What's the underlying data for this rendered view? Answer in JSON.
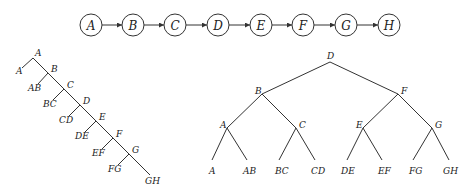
{
  "chain": {
    "nodes": [
      {
        "label": "A",
        "cx": 91
      },
      {
        "label": "B",
        "cx": 133
      },
      {
        "label": "C",
        "cx": 175
      },
      {
        "label": "D",
        "cx": 218
      },
      {
        "label": "E",
        "cx": 261
      },
      {
        "label": "F",
        "cx": 303
      },
      {
        "label": "G",
        "cx": 346
      },
      {
        "label": "H",
        "cx": 389
      }
    ],
    "cy": 25,
    "r": 11
  },
  "left_tree": {
    "spine_nodes": [
      {
        "label": "A",
        "x": 33,
        "y": 58,
        "lx": 35,
        "ly": 56
      },
      {
        "label": "B",
        "x": 48,
        "y": 73,
        "lx": 51,
        "ly": 72
      },
      {
        "label": "C",
        "x": 64,
        "y": 89,
        "lx": 67,
        "ly": 88
      },
      {
        "label": "D",
        "x": 80,
        "y": 105,
        "lx": 83,
        "ly": 104
      },
      {
        "label": "E",
        "x": 96,
        "y": 121,
        "lx": 99,
        "ly": 120
      },
      {
        "label": "F",
        "x": 113,
        "y": 138,
        "lx": 116,
        "ly": 137
      },
      {
        "label": "G",
        "x": 129,
        "y": 154,
        "lx": 132,
        "ly": 153
      }
    ],
    "leaves": [
      {
        "label": "A",
        "x": 22,
        "y": 68,
        "lx": 16,
        "ly": 74
      },
      {
        "label": "AB",
        "x": 38,
        "y": 84,
        "lx": 28,
        "ly": 91
      },
      {
        "label": "BC",
        "x": 53,
        "y": 100,
        "lx": 43,
        "ly": 107
      },
      {
        "label": "CD",
        "x": 69,
        "y": 116,
        "lx": 59,
        "ly": 123
      },
      {
        "label": "DE",
        "x": 85,
        "y": 132,
        "lx": 75,
        "ly": 139
      },
      {
        "label": "EF",
        "x": 102,
        "y": 149,
        "lx": 92,
        "ly": 156
      },
      {
        "label": "FG",
        "x": 118,
        "y": 165,
        "lx": 108,
        "ly": 172
      }
    ],
    "end": {
      "label": "GH",
      "x": 150,
      "y": 175,
      "lx": 145,
      "ly": 184
    }
  },
  "right_tree": {
    "internal": [
      {
        "id": "D",
        "label": "D",
        "x": 330,
        "y": 62,
        "lx": 327,
        "ly": 59
      },
      {
        "id": "B",
        "label": "B",
        "x": 262,
        "y": 94,
        "lx": 255,
        "ly": 94
      },
      {
        "id": "F",
        "label": "F",
        "x": 398,
        "y": 94,
        "lx": 401,
        "ly": 94
      },
      {
        "id": "A",
        "label": "A",
        "x": 227,
        "y": 128,
        "lx": 220,
        "ly": 128
      },
      {
        "id": "C",
        "label": "C",
        "x": 296,
        "y": 128,
        "lx": 299,
        "ly": 128
      },
      {
        "id": "E",
        "label": "E",
        "x": 363,
        "y": 128,
        "lx": 356,
        "ly": 128
      },
      {
        "id": "G",
        "label": "G",
        "x": 432,
        "y": 128,
        "lx": 435,
        "ly": 128
      }
    ],
    "leaves": [
      {
        "label": "A",
        "parent": "A",
        "x": 212,
        "y": 160,
        "lx": 209,
        "ly": 174
      },
      {
        "label": "AB",
        "parent": "A",
        "x": 247,
        "y": 160,
        "lx": 243,
        "ly": 174
      },
      {
        "label": "BC",
        "parent": "C",
        "x": 279,
        "y": 160,
        "lx": 275,
        "ly": 174
      },
      {
        "label": "CD",
        "parent": "C",
        "x": 315,
        "y": 160,
        "lx": 311,
        "ly": 174
      },
      {
        "label": "DE",
        "parent": "E",
        "x": 347,
        "y": 160,
        "lx": 341,
        "ly": 174
      },
      {
        "label": "EF",
        "parent": "E",
        "x": 382,
        "y": 160,
        "lx": 378,
        "ly": 174
      },
      {
        "label": "FG",
        "parent": "G",
        "x": 413,
        "y": 160,
        "lx": 409,
        "ly": 174
      },
      {
        "label": "GH",
        "parent": "G",
        "x": 449,
        "y": 160,
        "lx": 443,
        "ly": 174
      }
    ],
    "edges": [
      [
        "D",
        "B"
      ],
      [
        "D",
        "F"
      ],
      [
        "B",
        "A"
      ],
      [
        "B",
        "C"
      ],
      [
        "F",
        "E"
      ],
      [
        "F",
        "G"
      ]
    ]
  }
}
